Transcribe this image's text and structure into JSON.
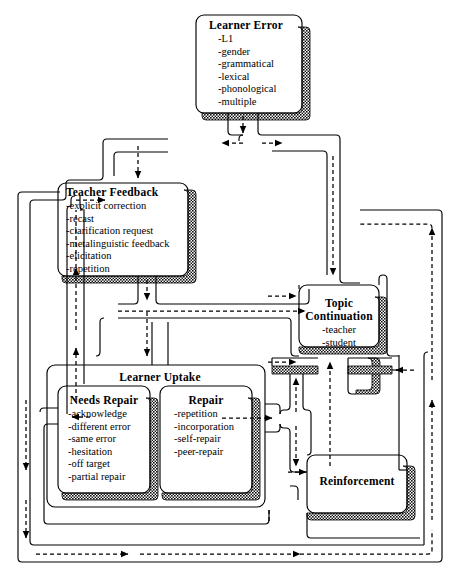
{
  "figure": {
    "type": "flowchart",
    "colors": {
      "stroke": "#000000",
      "background": "#ffffff",
      "shadow_fill": "#3a3a3a"
    }
  },
  "nodes": [
    {
      "id": "learner-error",
      "title": "Learner Error",
      "items": [
        "-L1",
        "-gender",
        "-grammatical",
        "-lexical",
        "-phonological",
        "-multiple"
      ]
    },
    {
      "id": "teacher-feedback",
      "title": "Teacher Feedback",
      "items": [
        "-explicit correction",
        "-recast",
        "-clarification request",
        "-metalinguistic feedback",
        "-elicitation",
        "-repetition"
      ]
    },
    {
      "id": "learner-uptake",
      "title": "Learner Uptake",
      "items": []
    },
    {
      "id": "needs-repair",
      "title": "Needs Repair",
      "items": [
        "-acknowledge",
        "-different error",
        "-same error",
        "-hesitation",
        "-off target",
        "-partial repair"
      ]
    },
    {
      "id": "repair",
      "title": "Repair",
      "items": [
        "-repetition",
        "-incorporation",
        "-self-repair",
        "-peer-repair"
      ]
    },
    {
      "id": "topic-continuation",
      "title": "Topic\nContinuation",
      "title_line1": "Topic",
      "title_line2": "Continuation",
      "items": [
        "-teacher",
        "-student"
      ]
    },
    {
      "id": "reinforcement",
      "title": "Reinforcement",
      "items": []
    }
  ],
  "flows": [
    {
      "from": "learner-error",
      "to": "teacher-feedback",
      "style": "dashed"
    },
    {
      "from": "learner-error",
      "to": "topic-continuation",
      "style": "dashed"
    },
    {
      "from": "teacher-feedback",
      "to": "learner-uptake",
      "style": "dashed"
    },
    {
      "from": "teacher-feedback",
      "to": "topic-continuation",
      "style": "dashed"
    },
    {
      "from": "needs-repair",
      "to": "teacher-feedback",
      "style": "dashed"
    },
    {
      "from": "repair",
      "to": "topic-continuation",
      "style": "dashed"
    },
    {
      "from": "repair",
      "to": "reinforcement",
      "style": "dashed"
    },
    {
      "from": "reinforcement",
      "to": "topic-continuation",
      "style": "dashed"
    },
    {
      "from": "reinforcement",
      "to": "learner-error",
      "style": "dashed"
    },
    {
      "from": "learner-uptake",
      "to": "learner-error",
      "style": "dashed"
    }
  ]
}
